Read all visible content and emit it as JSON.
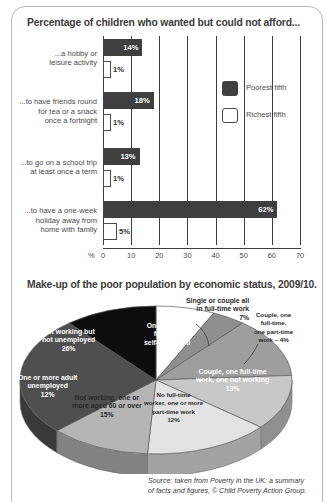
{
  "frame": {
    "border_color": "#b9b9b9"
  },
  "bar_section": {
    "title": "Percentage of children who wanted but could not afford...",
    "legend": [
      {
        "label": "Poorest fifth",
        "color": "#3f3f3f",
        "style": "filled"
      },
      {
        "label": "Richest fifth",
        "color": "#ffffff",
        "style": "outlined"
      }
    ],
    "axis_unit": "%"
  },
  "pie_section": {
    "title": "Make-up of the poor population by economic status, 2009/10."
  },
  "source": {
    "line1": "Source: taken from Poverty in the UK: a summary",
    "line2": "of facts and figures, © Child Poverty Action Group."
  },
  "chart_data": [
    {
      "type": "bar",
      "orientation": "horizontal",
      "title": "Percentage of children who wanted but could not afford...",
      "xlabel": "%",
      "ylabel": "",
      "xlim": [
        0,
        70
      ],
      "xticks": [
        0,
        10,
        20,
        30,
        40,
        50,
        60,
        70
      ],
      "grid": true,
      "categories": [
        "...a hobby or leisure activity",
        "...to have friends round for tea or a snack once a fortnight",
        "...to go on a school trip at least once a term",
        "...to have a one-week holiday away from home with family"
      ],
      "category_lines": [
        [
          "...a hobby or",
          "leisure activity"
        ],
        [
          "...to have friends round",
          "for tea or a snack",
          "once a fortnight"
        ],
        [
          "...to go on a school trip",
          "at least once a term"
        ],
        [
          "...to have a one-week",
          "holiday away from",
          "home with family"
        ]
      ],
      "series": [
        {
          "name": "Poorest fifth",
          "color": "#3f3f3f",
          "values": [
            14,
            18,
            13,
            62
          ],
          "labels": [
            "14%",
            "18%",
            "13%",
            "62%"
          ]
        },
        {
          "name": "Richest fifth",
          "color": "#ffffff",
          "values": [
            1,
            1,
            1,
            5
          ],
          "labels": [
            "1%",
            "1%",
            "1%",
            "5%"
          ]
        }
      ]
    },
    {
      "type": "pie",
      "title": "Make-up of the poor population by economic status, 2009/10.",
      "legend_position": "labels-on-slices",
      "slices": [
        {
          "label": "Single or couple all in full-time work",
          "value": 7,
          "pct_label": "7%",
          "color": "#ffffff",
          "label_lines": [
            "Single or couple all",
            "in full-time work",
            "7%"
          ],
          "placement": "outside"
        },
        {
          "label": "Couple, one full-time, one part-time work",
          "value": 4,
          "pct_label": "4%",
          "color": "#8f8f8f",
          "label_lines": [
            "Couple, one",
            "full-time,",
            "one part-time",
            "work – 4%"
          ],
          "placement": "outside"
        },
        {
          "label": "Couple, one full-time work, one not working",
          "value": 13,
          "pct_label": "13%",
          "color": "#9e9e9e",
          "label_lines": [
            "Couple, one full-time",
            "work, one not working",
            "13%"
          ],
          "placement": "inside"
        },
        {
          "label": "No full-time worker, one or more part-time work",
          "value": 12,
          "pct_label": "12%",
          "color": "#c8c8c8",
          "label_lines": [
            "No full-time",
            "worker, one or more",
            "part-time work",
            "12%"
          ],
          "placement": "inside"
        },
        {
          "label": "Not working, one or more aged 60 or over",
          "value": 15,
          "pct_label": "15%",
          "color": "#e3e3e3",
          "label_lines": [
            "Not working, one or",
            "more aged 60 or over",
            "15%"
          ],
          "placement": "inside"
        },
        {
          "label": "One or more adult unemployed",
          "value": 12,
          "pct_label": "12%",
          "color": "#b5b5b5",
          "label_lines": [
            "One or more adult",
            "unemployed",
            "12%"
          ],
          "placement": "inside"
        },
        {
          "label": "Not working but not unemployed",
          "value": 26,
          "pct_label": "26%",
          "color": "#4f4f4f",
          "label_lines": [
            "Not working but",
            "not unemployed",
            "26%"
          ],
          "placement": "inside"
        },
        {
          "label": "One or more full-time self-employed",
          "value": 11,
          "pct_label": "11%",
          "color": "#0d0d0d",
          "label_lines": [
            "One or more",
            "full-time",
            "self-employed",
            "11%"
          ],
          "placement": "inside"
        }
      ]
    }
  ]
}
